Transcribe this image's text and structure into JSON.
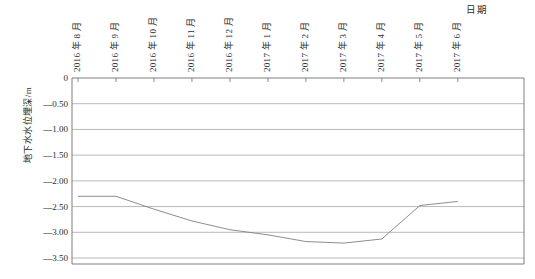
{
  "chart_data": {
    "type": "line",
    "title": "",
    "xlabel": "日期",
    "ylabel": "地下水水位埋深/m",
    "categories": [
      "2016 年 8 月",
      "2016 年 9 月",
      "2016 年 10 月",
      "2016 年 11 月",
      "2016 年 12 月",
      "2017 年 1 月",
      "2017 年 2 月",
      "2017 年 3 月",
      "2017 年 4 月",
      "2017 年 5 月",
      "2017 年 6 月"
    ],
    "values": [
      -2.3,
      -2.3,
      -2.55,
      -2.78,
      -2.95,
      -3.05,
      -3.18,
      -3.21,
      -3.13,
      -2.48,
      -2.4
    ],
    "series": [
      {
        "name": "地下水水位埋深",
        "values": [
          -2.3,
          -2.3,
          -2.55,
          -2.78,
          -2.95,
          -3.05,
          -3.18,
          -3.21,
          -3.13,
          -2.48,
          -2.4
        ]
      }
    ],
    "ylim": [
      -3.5,
      0
    ],
    "ytick_labels": [
      "0",
      "—0.50",
      "—1.00",
      "—1.50",
      "—2.00",
      "—2.50",
      "—3.00",
      "—3.50"
    ],
    "ytick_values": [
      0,
      -0.5,
      -1.0,
      -1.5,
      -2.0,
      -2.5,
      -3.0,
      -3.5
    ],
    "grid": "horizontal",
    "legend": "none",
    "line_color": "#808080",
    "grid_color": "#9a9a9a",
    "axis_color": "#6f6f6f",
    "xaxis_position": "top"
  }
}
